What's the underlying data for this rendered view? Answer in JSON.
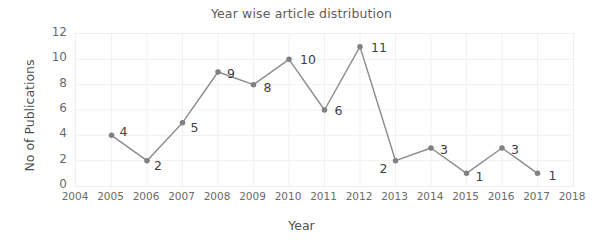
{
  "chart_data": {
    "type": "line",
    "title": "Year wise article distribution",
    "xlabel": "Year",
    "ylabel": "No of Publications",
    "x": [
      2005,
      2006,
      2007,
      2008,
      2009,
      2010,
      2011,
      2012,
      2013,
      2014,
      2015,
      2016,
      2017
    ],
    "values": [
      4,
      2,
      5,
      9,
      8,
      10,
      6,
      11,
      2,
      3,
      1,
      3,
      1
    ],
    "point_labels": [
      "4",
      "2",
      "5",
      "9",
      "8",
      "10",
      "6",
      "11",
      "2",
      "3",
      "1",
      "3",
      "1"
    ],
    "label_offsets": [
      {
        "dx": 9,
        "dy": -2
      },
      {
        "dx": 8,
        "dy": 6
      },
      {
        "dx": 9,
        "dy": 6
      },
      {
        "dx": 10,
        "dy": 3
      },
      {
        "dx": 11,
        "dy": 4
      },
      {
        "dx": 12,
        "dy": 2
      },
      {
        "dx": 11,
        "dy": 2
      },
      {
        "dx": 12,
        "dy": 2
      },
      {
        "dx": -15,
        "dy": 9
      },
      {
        "dx": 10,
        "dy": 3
      },
      {
        "dx": 10,
        "dy": 5
      },
      {
        "dx": 10,
        "dy": 3
      },
      {
        "dx": 12,
        "dy": 4
      }
    ],
    "xticks": [
      2004,
      2005,
      2006,
      2007,
      2008,
      2009,
      2010,
      2011,
      2012,
      2013,
      2014,
      2015,
      2016,
      2017,
      2018
    ],
    "xtick_labels": [
      "2004",
      "2005",
      "2006",
      "2007",
      "2008",
      "2009",
      "2010",
      "2011",
      "2012",
      "2013",
      "2014",
      "2015",
      "2016",
      "2017",
      "2018"
    ],
    "yticks": [
      0,
      2,
      4,
      6,
      8,
      10,
      12
    ],
    "ytick_labels": [
      "0",
      "2",
      "4",
      "6",
      "8",
      "10",
      "12"
    ],
    "xlim": [
      2004,
      2018
    ],
    "ylim": [
      0,
      12
    ],
    "grid": true,
    "legend": false,
    "colors": {
      "line": "#8c8c8c",
      "marker": "#808080",
      "grid": "#f1f1f1",
      "border": "#efefef",
      "text": "#5a5a5a",
      "background": "#ffffff"
    },
    "marker": "circle",
    "marker_size": 4,
    "line_width": 1.4
  }
}
